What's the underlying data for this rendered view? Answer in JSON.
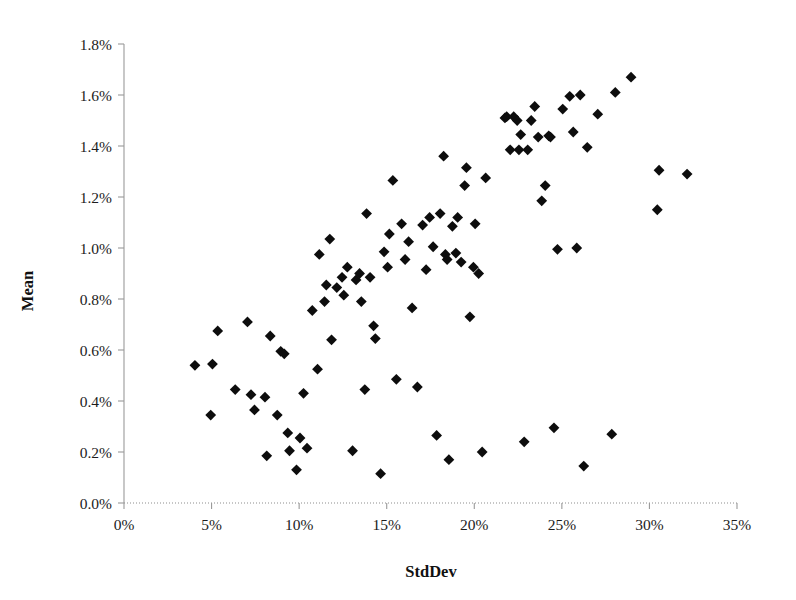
{
  "chart_data": {
    "type": "scatter",
    "title": "",
    "xlabel": "StdDev",
    "ylabel": "Mean",
    "xlim": [
      0,
      35
    ],
    "ylim": [
      0,
      1.8
    ],
    "grid": false,
    "legend": null,
    "x_unit": "%",
    "y_unit": "%",
    "xticks": [
      0,
      5,
      10,
      15,
      20,
      25,
      30,
      35
    ],
    "xtick_labels": [
      "0%",
      "5%",
      "10%",
      "15%",
      "20%",
      "25%",
      "30%",
      "35%"
    ],
    "yticks": [
      0.0,
      0.2,
      0.4,
      0.6,
      0.8,
      1.0,
      1.2,
      1.4,
      1.6,
      1.8
    ],
    "ytick_labels": [
      "0.0%",
      "0.2%",
      "0.4%",
      "0.6%",
      "0.8%",
      "1.0%",
      "1.2%",
      "1.4%",
      "1.6%",
      "1.8%"
    ],
    "marker": "diamond",
    "marker_color": "#0d0d0d",
    "marker_size": 5.4,
    "point_count": 104,
    "points": [
      [
        4.05,
        0.54
      ],
      [
        4.95,
        0.345
      ],
      [
        5.05,
        0.545
      ],
      [
        5.35,
        0.675
      ],
      [
        6.35,
        0.445
      ],
      [
        7.05,
        0.71
      ],
      [
        7.25,
        0.425
      ],
      [
        7.45,
        0.365
      ],
      [
        8.05,
        0.415
      ],
      [
        8.15,
        0.185
      ],
      [
        8.35,
        0.655
      ],
      [
        8.75,
        0.345
      ],
      [
        8.95,
        0.595
      ],
      [
        9.15,
        0.585
      ],
      [
        9.35,
        0.275
      ],
      [
        9.45,
        0.205
      ],
      [
        9.85,
        0.13
      ],
      [
        10.05,
        0.255
      ],
      [
        10.25,
        0.43
      ],
      [
        10.45,
        0.215
      ],
      [
        10.75,
        0.755
      ],
      [
        11.05,
        0.525
      ],
      [
        11.15,
        0.975
      ],
      [
        11.45,
        0.79
      ],
      [
        11.55,
        0.855
      ],
      [
        11.75,
        1.035
      ],
      [
        11.85,
        0.64
      ],
      [
        12.15,
        0.845
      ],
      [
        12.45,
        0.885
      ],
      [
        12.55,
        0.815
      ],
      [
        12.75,
        0.925
      ],
      [
        13.05,
        0.205
      ],
      [
        13.25,
        0.875
      ],
      [
        13.45,
        0.9
      ],
      [
        13.55,
        0.79
      ],
      [
        13.75,
        0.445
      ],
      [
        13.85,
        1.135
      ],
      [
        14.05,
        0.885
      ],
      [
        14.25,
        0.695
      ],
      [
        14.35,
        0.645
      ],
      [
        14.65,
        0.115
      ],
      [
        14.85,
        0.985
      ],
      [
        15.05,
        0.925
      ],
      [
        15.15,
        1.055
      ],
      [
        15.35,
        1.265
      ],
      [
        15.55,
        0.485
      ],
      [
        15.85,
        1.095
      ],
      [
        16.05,
        0.955
      ],
      [
        16.25,
        1.025
      ],
      [
        16.45,
        0.765
      ],
      [
        16.75,
        0.455
      ],
      [
        17.05,
        1.09
      ],
      [
        17.25,
        0.915
      ],
      [
        17.45,
        1.12
      ],
      [
        17.65,
        1.005
      ],
      [
        17.85,
        0.265
      ],
      [
        18.05,
        1.135
      ],
      [
        18.25,
        1.36
      ],
      [
        18.35,
        0.975
      ],
      [
        18.45,
        0.955
      ],
      [
        18.55,
        0.17
      ],
      [
        18.75,
        1.085
      ],
      [
        18.95,
        0.98
      ],
      [
        19.05,
        1.12
      ],
      [
        19.25,
        0.945
      ],
      [
        19.45,
        1.245
      ],
      [
        19.55,
        1.315
      ],
      [
        19.75,
        0.73
      ],
      [
        19.95,
        0.925
      ],
      [
        20.05,
        1.095
      ],
      [
        20.25,
        0.9
      ],
      [
        20.45,
        0.2
      ],
      [
        20.65,
        1.275
      ],
      [
        21.75,
        1.51
      ],
      [
        21.85,
        1.515
      ],
      [
        22.05,
        1.385
      ],
      [
        22.25,
        1.515
      ],
      [
        22.45,
        1.5
      ],
      [
        22.55,
        1.385
      ],
      [
        22.65,
        1.445
      ],
      [
        22.85,
        0.24
      ],
      [
        23.05,
        1.385
      ],
      [
        23.25,
        1.5
      ],
      [
        23.45,
        1.555
      ],
      [
        23.65,
        1.435
      ],
      [
        23.85,
        1.185
      ],
      [
        24.05,
        1.245
      ],
      [
        24.25,
        1.44
      ],
      [
        24.35,
        1.435
      ],
      [
        24.55,
        0.295
      ],
      [
        24.75,
        0.995
      ],
      [
        25.05,
        1.545
      ],
      [
        25.45,
        1.595
      ],
      [
        25.65,
        1.455
      ],
      [
        25.85,
        1.0
      ],
      [
        26.05,
        1.6
      ],
      [
        26.25,
        0.145
      ],
      [
        26.45,
        1.395
      ],
      [
        27.05,
        1.525
      ],
      [
        27.85,
        0.27
      ],
      [
        28.05,
        1.61
      ],
      [
        28.95,
        1.67
      ],
      [
        30.45,
        1.15
      ],
      [
        30.55,
        1.305
      ],
      [
        32.15,
        1.29
      ]
    ]
  },
  "axes": {
    "y_axis_title": "Mean",
    "x_axis_title": "StdDev"
  }
}
